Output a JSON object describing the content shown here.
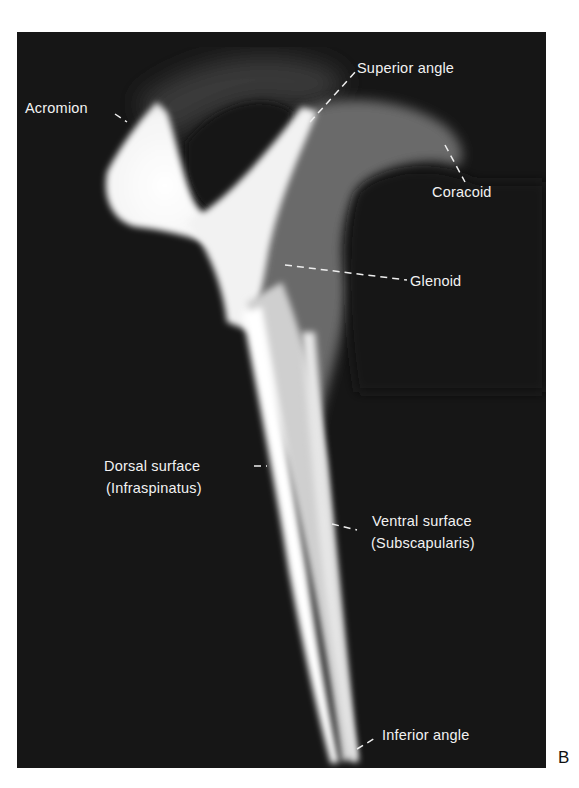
{
  "figure": {
    "panel_letter": "B",
    "labels": {
      "acromion": "Acromion",
      "superior_angle": "Superior angle",
      "coracoid": "Coracoid",
      "glenoid": "Glenoid",
      "dorsal_surface_line1": "Dorsal surface",
      "dorsal_surface_line2": "(Infraspinatus)",
      "ventral_surface_line1": "Ventral surface",
      "ventral_surface_line2": "(Subscapularis)",
      "inferior_angle": "Inferior angle"
    }
  }
}
